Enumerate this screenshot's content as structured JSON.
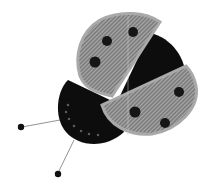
{
  "image": {
    "subject": "crocheted ladybug",
    "description": "Grayscale photo of a crocheted ladybug with two gray speckled wings with black bead spots, black body, and black head with two antennae ending in beads",
    "colors": {
      "background": "#ffffff",
      "wing": "#8a8a8a",
      "wing_edge": "#a8a8a8",
      "body": "#0c0c0c",
      "spot": "#141414",
      "antenna": "#777777"
    }
  }
}
